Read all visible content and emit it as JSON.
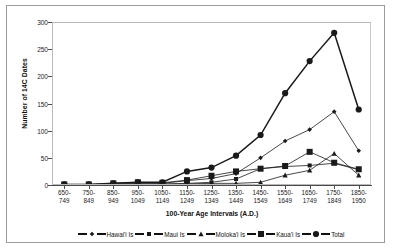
{
  "chart_data": {
    "type": "line",
    "title": "",
    "xlabel": "100-Year Age Intervals (A.D.)",
    "ylabel": "Number of 14C Dates",
    "ylim": [
      0,
      300
    ],
    "yticks": [
      0,
      50,
      100,
      150,
      200,
      250,
      300
    ],
    "grid": false,
    "legend_position": "bottom",
    "categories": [
      "650-\n749",
      "750-\n849",
      "850-\n949",
      "950-\n1049",
      "1050-\n1149",
      "1150-\n1249",
      "1250-\n1349",
      "1350-\n1449",
      "1450-\n1549",
      "1550-\n1649",
      "1650-\n1749",
      "1750-\n1849",
      "1850-\n1950"
    ],
    "category_lines": [
      [
        "650-",
        "749"
      ],
      [
        "750-",
        "849"
      ],
      [
        "850-",
        "949"
      ],
      [
        "950-",
        "1049"
      ],
      [
        "1050-",
        "1149"
      ],
      [
        "1150-",
        "1249"
      ],
      [
        "1250-",
        "1349"
      ],
      [
        "1350-",
        "1449"
      ],
      [
        "1450-",
        "1549"
      ],
      [
        "1550-",
        "1649"
      ],
      [
        "1650-",
        "1749"
      ],
      [
        "1750-",
        "1849"
      ],
      [
        "1850-",
        "1950"
      ]
    ],
    "series": [
      {
        "name": "Hawai'i Is",
        "marker": "diamond",
        "color": "#1a1a1a",
        "values": [
          1,
          1,
          2,
          3,
          3,
          8,
          12,
          21,
          50,
          81,
          102,
          135,
          63
        ]
      },
      {
        "name": "Maui Is",
        "marker": "square-small",
        "color": "#1a1a1a",
        "values": [
          0,
          0,
          1,
          2,
          2,
          3,
          5,
          11,
          30,
          34,
          36,
          40,
          28
        ]
      },
      {
        "name": "Moloka'i Is",
        "marker": "triangle",
        "color": "#1a1a1a",
        "values": [
          0,
          0,
          0,
          1,
          1,
          2,
          3,
          3,
          5,
          18,
          27,
          58,
          18
        ]
      },
      {
        "name": "Kaua'i Is",
        "marker": "square-large",
        "color": "#1a1a1a",
        "values": [
          1,
          1,
          3,
          5,
          4,
          9,
          17,
          25,
          30,
          35,
          61,
          41,
          29
        ]
      },
      {
        "name": "Total",
        "marker": "circle",
        "color": "#1a1a1a",
        "values": [
          1,
          1,
          3,
          5,
          5,
          25,
          32,
          54,
          92,
          169,
          228,
          280,
          139
        ]
      }
    ]
  },
  "legend": {
    "items": [
      {
        "label": "Hawai'i Is"
      },
      {
        "label": "Maui Is"
      },
      {
        "label": "Moloka'i Is"
      },
      {
        "label": "Kaua'i Is"
      },
      {
        "label": "Total"
      }
    ]
  },
  "axes": {
    "y_title": "Number of 14C Dates",
    "x_title": "100-Year Age Intervals (A.D.)"
  }
}
